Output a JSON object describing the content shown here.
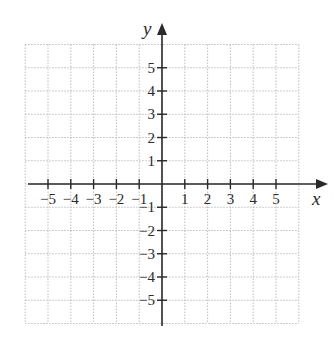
{
  "diagram": {
    "type": "coordinate-plane",
    "x_axis": {
      "label": "x",
      "min": -6,
      "max": 6,
      "tick_labels": [
        "−5",
        "−4",
        "−3",
        "−2",
        "−1",
        "1",
        "2",
        "3",
        "4",
        "5"
      ],
      "tick_values": [
        -5,
        -4,
        -3,
        -2,
        -1,
        1,
        2,
        3,
        4,
        5
      ]
    },
    "y_axis": {
      "label": "y",
      "min": -6,
      "max": 6,
      "tick_labels": [
        "5",
        "4",
        "3",
        "2",
        "1",
        "−1",
        "−2",
        "−3",
        "−4",
        "−5"
      ],
      "tick_values": [
        5,
        4,
        3,
        2,
        1,
        -1,
        -2,
        -3,
        -4,
        -5
      ]
    },
    "grid": {
      "style": "dotted",
      "spacing": 1,
      "color": "#bdbdbd"
    },
    "axis_color": "#2a2a2a"
  }
}
